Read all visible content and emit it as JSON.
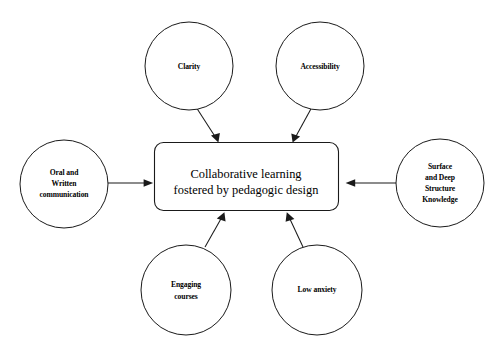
{
  "diagram": {
    "title_fragment": "cut-off text",
    "center_node": {
      "name": "collaborative-learning",
      "lines": [
        "Collaborative learning",
        "fostered by pedagogic design"
      ],
      "shape": "rounded-rectangle"
    },
    "nodes": [
      {
        "name": "clarity",
        "lines": [
          "Clarity"
        ],
        "position": "top-left",
        "shape": "circle"
      },
      {
        "name": "accessibility",
        "lines": [
          "Accessibility"
        ],
        "position": "top-right",
        "shape": "circle"
      },
      {
        "name": "oral-and-written-communication",
        "lines": [
          "Oral and",
          "Written",
          "communication"
        ],
        "position": "left",
        "shape": "circle"
      },
      {
        "name": "surface-and-deep-structure-knowledge",
        "lines": [
          "Surface",
          "and Deep",
          "Structure",
          "Knowledge"
        ],
        "position": "right",
        "shape": "circle"
      },
      {
        "name": "engaging-courses",
        "lines": [
          "Engaging",
          "courses"
        ],
        "position": "bottom-left",
        "shape": "circle"
      },
      {
        "name": "low-anxiety",
        "lines": [
          "Low anxiety"
        ],
        "position": "bottom-right",
        "shape": "circle"
      }
    ],
    "edges": [
      {
        "name": "edge-clarity-to-center",
        "from": "clarity",
        "to": "collaborative-learning",
        "direction": "in"
      },
      {
        "name": "edge-accessibility-to-center",
        "from": "accessibility",
        "to": "collaborative-learning",
        "direction": "in"
      },
      {
        "name": "edge-oral-written-to-center",
        "from": "oral-and-written-communication",
        "to": "collaborative-learning",
        "direction": "in"
      },
      {
        "name": "edge-surface-deep-to-center",
        "from": "surface-and-deep-structure-knowledge",
        "to": "collaborative-learning",
        "direction": "in"
      },
      {
        "name": "edge-engaging-courses-to-center",
        "from": "engaging-courses",
        "to": "collaborative-learning",
        "direction": "in"
      },
      {
        "name": "edge-low-anxiety-to-center",
        "from": "low-anxiety",
        "to": "collaborative-learning",
        "direction": "in"
      }
    ],
    "colors": {
      "stroke": "#1a1a1a",
      "fill": "#ffffff",
      "text": "#000000",
      "background": "#ffffff"
    }
  }
}
